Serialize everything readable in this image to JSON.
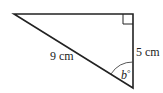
{
  "diagram": {
    "type": "right-triangle",
    "labels": {
      "hypotenuse": "9 cm",
      "vertical_side": "5 cm",
      "angle_var": "b",
      "angle_unit": "°"
    },
    "right_angle_at": "top-right"
  }
}
